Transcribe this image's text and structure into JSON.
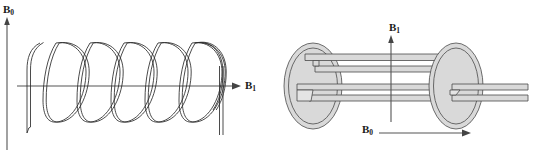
{
  "figure": {
    "background_color": "#ffffff",
    "panels": [
      {
        "id": "left",
        "name": "solenoid-coil-panel",
        "coil_type": "solenoid",
        "turns": 6,
        "axes": [
          {
            "name": "vertical-axis",
            "label": "B",
            "subscript": "0",
            "orientation": "vertical",
            "direction": "up"
          },
          {
            "name": "horizontal-axis",
            "label": "B",
            "subscript": "1",
            "orientation": "horizontal",
            "direction": "right"
          }
        ]
      },
      {
        "id": "right",
        "name": "saddle-coil-panel",
        "coil_type": "saddle",
        "rings": 2,
        "axes": [
          {
            "name": "vertical-axis",
            "label": "B",
            "subscript": "1",
            "orientation": "vertical",
            "direction": "up"
          },
          {
            "name": "horizontal-axis",
            "label": "B",
            "subscript": "0",
            "orientation": "horizontal",
            "direction": "right"
          }
        ]
      }
    ],
    "labels": {
      "left_b0": "B",
      "left_b0_sub": "0",
      "left_b1": "B",
      "left_b1_sub": "1",
      "right_b1": "B",
      "right_b1_sub": "1",
      "right_b0": "B",
      "right_b0_sub": "0"
    },
    "colors": {
      "wire_stroke": "#2b2b2b",
      "axis_stroke": "#555555",
      "band_fill": "#d9d9d9",
      "band_stroke": "#4a4a4a",
      "text": "#1a1a1a"
    }
  }
}
